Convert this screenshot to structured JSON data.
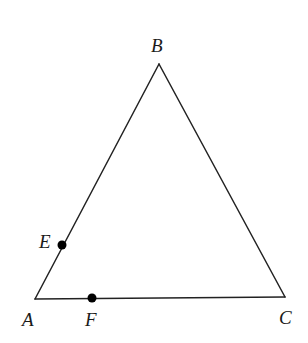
{
  "figure": {
    "type": "geometry-diagram",
    "background_color": "#ffffff",
    "stroke_color": "#222222",
    "stroke_width": 1.5,
    "point_fill_color": "#000000",
    "canvas": {
      "width": 308,
      "height": 343
    },
    "vertices": [
      {
        "id": "A",
        "label": "A",
        "x": 35,
        "y": 299,
        "label_x": 22,
        "label_y": 310
      },
      {
        "id": "B",
        "label": "B",
        "x": 159,
        "y": 64,
        "label_x": 151,
        "label_y": 36
      },
      {
        "id": "C",
        "label": "C",
        "x": 285,
        "y": 297,
        "label_x": 279,
        "label_y": 308
      }
    ],
    "points": [
      {
        "id": "E",
        "label": "E",
        "x": 62,
        "y": 245,
        "radius": 4.5,
        "label_x": 39,
        "label_y": 232,
        "on_segment": "AB"
      },
      {
        "id": "F",
        "label": "F",
        "x": 92,
        "y": 298,
        "radius": 4.5,
        "label_x": 85,
        "label_y": 310,
        "on_segment": "AC"
      }
    ],
    "segments": [
      {
        "id": "AB",
        "from": "A",
        "to": "B"
      },
      {
        "id": "BC",
        "from": "B",
        "to": "C"
      },
      {
        "id": "AC",
        "from": "A",
        "to": "C"
      }
    ]
  }
}
